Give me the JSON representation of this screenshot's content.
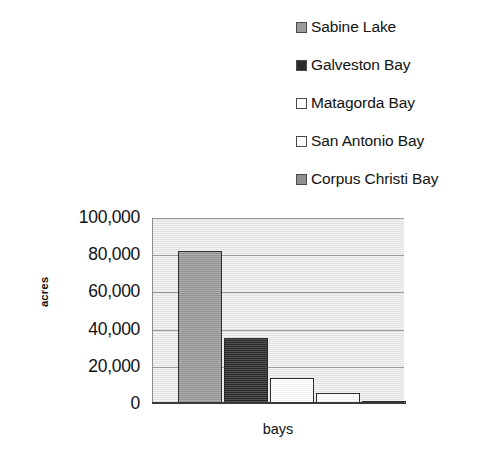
{
  "chart_data": {
    "type": "bar",
    "title": "",
    "xlabel": "bays",
    "ylabel": "acres",
    "categories": [
      "Sabine Lake",
      "Galveston Bay",
      "Matagorda Bay",
      "San Antonio Bay",
      "Corpus Christi Bay"
    ],
    "values": [
      82000,
      35500,
      14000,
      6000,
      1000
    ],
    "ylim": [
      0,
      100000
    ],
    "ytick_labels": [
      "100,000",
      "80,000",
      "60,000",
      "40,000",
      "20,000",
      "0"
    ],
    "ytick_values": [
      100000,
      80000,
      60000,
      40000,
      20000,
      0
    ],
    "xtick_labels": [],
    "grid": true,
    "legend_position": "top-right",
    "bar_colors": [
      "#9b9b9b",
      "#2b2b2b",
      "#ffffff",
      "#ffffff",
      "#8f8f8f"
    ],
    "plot_background": "#e6e6e6",
    "gridline_color": "#9a9a9a",
    "bar_border_color": "#2c2c2c"
  },
  "legend": {
    "items": [
      {
        "label": "Sabine Lake",
        "swatch": "#9b9b9b"
      },
      {
        "label": "Galveston Bay",
        "swatch": "#2b2b2b"
      },
      {
        "label": "Matagorda Bay",
        "swatch": "#ffffff"
      },
      {
        "label": "San Antonio Bay",
        "swatch": "#ffffff"
      },
      {
        "label": "Corpus Christi Bay",
        "swatch": "#8f8f8f"
      }
    ]
  }
}
